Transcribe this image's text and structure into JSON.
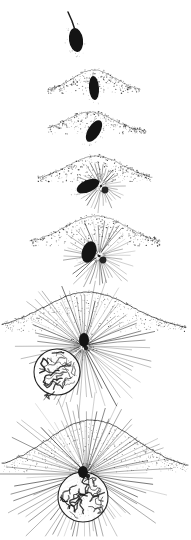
{
  "plate": {
    "title": "Fertilization stages of the egg",
    "medium": "stipple and line engraving",
    "background_color": "#ffffff",
    "ink_color": "#1a1a1a",
    "width": 191,
    "height": 540,
    "panel_count": 7,
    "orientation": "vertical sequence, top to bottom"
  },
  "stages": [
    {
      "index": 1,
      "name": "sperm-approaching-egg",
      "caption": "Spermatozoon approaching the egg surface",
      "center_x": 76,
      "center_y": 35,
      "sperm": {
        "head_cx": 76,
        "head_cy": 40,
        "head_rx": 7,
        "head_ry": 12,
        "head_rotation": -8,
        "tail_from_x": 68,
        "tail_from_y": 12,
        "tail_to_x": 75,
        "tail_to_y": 30,
        "color": "#141414"
      },
      "egg_surface": false,
      "aster": false,
      "egg_nucleus": false
    },
    {
      "index": 2,
      "name": "sperm-entry-cone",
      "caption": "Sperm entering; entrance cone raised on the egg surface",
      "center_x": 94,
      "center_y": 85,
      "sperm": {
        "head_cx": 94,
        "head_cy": 88,
        "head_rx": 5,
        "head_ry": 12,
        "head_rotation": -4,
        "color": "#141414"
      },
      "egg_surface": {
        "apex_x": 94,
        "apex_y": 70,
        "left_x": 48,
        "right_x": 140,
        "baseline_y": 92,
        "style": "stippled cone"
      },
      "aster": false,
      "egg_nucleus": false
    },
    {
      "index": 3,
      "name": "sperm-rotating-inside",
      "caption": "Sperm head rotating within the egg cortex",
      "center_x": 94,
      "center_y": 126,
      "sperm": {
        "head_cx": 94,
        "head_cy": 131,
        "head_rx": 6,
        "head_ry": 12,
        "head_rotation": 32,
        "color": "#141414"
      },
      "egg_surface": {
        "apex_x": 90,
        "apex_y": 112,
        "left_x": 48,
        "right_x": 146,
        "baseline_y": 132,
        "style": "stippled cone"
      },
      "aster": false,
      "egg_nucleus": false
    },
    {
      "index": 4,
      "name": "sperm-aster-forming",
      "caption": "Small sperm aster developing beside the sperm nucleus",
      "center_x": 96,
      "center_y": 180,
      "sperm": {
        "head_cx": 88,
        "head_cy": 186,
        "head_rx": 6,
        "head_ry": 12,
        "head_rotation": 66,
        "color": "#141414"
      },
      "egg_surface": {
        "apex_x": 96,
        "apex_y": 156,
        "left_x": 38,
        "right_x": 152,
        "baseline_y": 180,
        "style": "stippled cone"
      },
      "aster": {
        "cx": 101,
        "cy": 186,
        "radius": 27,
        "ray_count": 34,
        "centrosome": true
      },
      "egg_nucleus": false
    },
    {
      "index": 5,
      "name": "sperm-aster-enlarged",
      "caption": "Sperm nucleus upright with enlarged aster",
      "center_x": 96,
      "center_y": 250,
      "sperm": {
        "head_cx": 89,
        "head_cy": 252,
        "head_rx": 7,
        "head_ry": 11,
        "head_rotation": 18,
        "color": "#141414"
      },
      "egg_surface": {
        "apex_x": 96,
        "apex_y": 216,
        "left_x": 30,
        "right_x": 160,
        "baseline_y": 244,
        "style": "stippled cone"
      },
      "aster": {
        "cx": 99,
        "cy": 256,
        "radius": 38,
        "ray_count": 44,
        "centrosome": true
      },
      "egg_nucleus": false
    },
    {
      "index": 6,
      "name": "aster-with-egg-nucleus-approaching",
      "caption": "Large sperm aster; egg nucleus approaching from below left",
      "center_x": 84,
      "center_y": 345,
      "sperm": {
        "head_cx": 84,
        "head_cy": 340,
        "head_rx": 5,
        "head_ry": 7,
        "head_rotation": 0,
        "color": "#141414"
      },
      "egg_surface": {
        "apex_x": 88,
        "apex_y": 292,
        "left_x": 2,
        "right_x": 186,
        "baseline_y": 330,
        "style": "broad stippled dome"
      },
      "aster": {
        "cx": 84,
        "cy": 346,
        "radius": 74,
        "ray_count": 66,
        "centrosome": true
      },
      "egg_nucleus": {
        "cx": 57,
        "cy": 372,
        "r": 23,
        "chromatin": "reticular network"
      }
    },
    {
      "index": 7,
      "name": "pronuclei-in-contact",
      "caption": "Egg nucleus drawn into the centre of the enlarged aster",
      "center_x": 92,
      "center_y": 470,
      "sperm": {
        "head_cx": 83,
        "head_cy": 472,
        "head_rx": 5,
        "head_ry": 6,
        "head_rotation": 0,
        "color": "#141414"
      },
      "egg_surface": {
        "apex_x": 92,
        "apex_y": 420,
        "left_x": 2,
        "right_x": 188,
        "baseline_y": 470,
        "style": "broad arc"
      },
      "aster": {
        "cx": 86,
        "cy": 474,
        "radius": 88,
        "ray_count": 78,
        "centrosome": true
      },
      "egg_nucleus": {
        "cx": 83,
        "cy": 497,
        "r": 25,
        "chromatin": "reticular network"
      }
    }
  ]
}
